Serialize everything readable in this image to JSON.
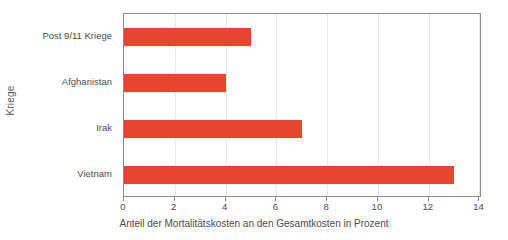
{
  "chart_data": {
    "type": "bar",
    "orientation": "horizontal",
    "title": "",
    "subtitle": "",
    "xlabel": "Anteil der Mortalitätskosten an den Gesamtkosten in Prozent",
    "ylabel": "Kriege",
    "categories": [
      "Post 9/11 Kriege",
      "Afghanistan",
      "Irak",
      "Vietnam"
    ],
    "values": [
      5,
      4,
      7,
      13
    ],
    "series": [
      {
        "name": "Anteil der Mortalitätskosten",
        "values": [
          5,
          4,
          7,
          13
        ]
      }
    ],
    "xlim": [
      0,
      14.1
    ],
    "xticks": [
      0,
      2,
      4,
      6,
      8,
      10,
      12,
      14
    ],
    "xtick_labels": [
      "0",
      "2",
      "4",
      "6",
      "8",
      "10",
      "12",
      "14"
    ],
    "grid": "vertical",
    "legend": "none",
    "bar_color": "#e8452e",
    "frame_color": "#8c8c8c",
    "gridline_color": "#e6e6e6",
    "background_color": "#ffffff",
    "annotations": []
  }
}
